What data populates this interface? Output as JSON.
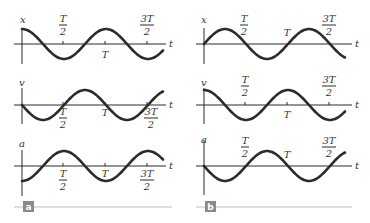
{
  "figure": {
    "panels": [
      {
        "label": "a",
        "graphs": [
          {
            "ylabel": "x",
            "xlabel": "t",
            "function": "cos",
            "phase": 0,
            "tick_labels_position": "above"
          },
          {
            "ylabel": "v",
            "xlabel": "t",
            "function": "-sin",
            "phase": 0,
            "tick_labels_position": "below"
          },
          {
            "ylabel": "a",
            "xlabel": "t",
            "function": "-cos",
            "phase": 0,
            "tick_labels_position": "below"
          }
        ]
      },
      {
        "label": "b",
        "graphs": [
          {
            "ylabel": "x",
            "xlabel": "t",
            "function": "sin",
            "phase": 0,
            "tick_labels_position": "above"
          },
          {
            "ylabel": "v",
            "xlabel": "t",
            "function": "cos",
            "phase": 0,
            "tick_labels_position": "above"
          },
          {
            "ylabel": "a",
            "xlabel": "t",
            "function": "-sin",
            "phase": 0,
            "tick_labels_position": "above"
          }
        ]
      }
    ],
    "ticks": [
      {
        "num": "T",
        "den": "2"
      },
      {
        "num": "T",
        "den": ""
      },
      {
        "num": "3T",
        "den": "2"
      }
    ]
  },
  "colors": {
    "curve": "#2b2b2b",
    "axis": "#2a2a2a",
    "badge": "#8a8a8a",
    "rule": "#bdbdbd"
  }
}
